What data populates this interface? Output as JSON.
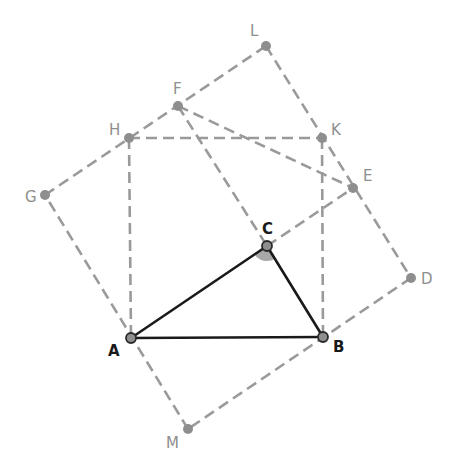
{
  "diagram": {
    "title": "",
    "colors": {
      "background": "#ffffff",
      "dashed_line": "#9a9a9a",
      "solid_line": "#1a1a1a",
      "point_fill_gray": "#8e8e8e",
      "point_fill_main": "#8e8e8e",
      "point_stroke_main": "#2a2a2a",
      "angle_fill": "#a8a8a8"
    },
    "points": [
      {
        "id": "A",
        "label": "A",
        "x": 131,
        "y": 338,
        "main": true,
        "lx": 108,
        "ly": 356
      },
      {
        "id": "B",
        "label": "B",
        "x": 323,
        "y": 337,
        "main": true,
        "lx": 333,
        "ly": 352
      },
      {
        "id": "C",
        "label": "C",
        "x": 267,
        "y": 246,
        "main": true,
        "lx": 262,
        "ly": 234
      },
      {
        "id": "D",
        "label": "D",
        "x": 411,
        "y": 278,
        "main": false,
        "lx": 421,
        "ly": 284
      },
      {
        "id": "E",
        "label": "E",
        "x": 353,
        "y": 188,
        "main": false,
        "lx": 363,
        "ly": 181
      },
      {
        "id": "F",
        "label": "F",
        "x": 178,
        "y": 106,
        "main": false,
        "lx": 173,
        "ly": 94
      },
      {
        "id": "G",
        "label": "G",
        "x": 45,
        "y": 195,
        "main": false,
        "lx": 25,
        "ly": 202
      },
      {
        "id": "H",
        "label": "H",
        "x": 129,
        "y": 138,
        "main": false,
        "lx": 109,
        "ly": 135
      },
      {
        "id": "K",
        "label": "K",
        "x": 322,
        "y": 138,
        "main": false,
        "lx": 331,
        "ly": 135
      },
      {
        "id": "L",
        "label": "L",
        "x": 266,
        "y": 46,
        "main": false,
        "lx": 250,
        "ly": 36
      },
      {
        "id": "M",
        "label": "M",
        "x": 188,
        "y": 429,
        "main": false,
        "lx": 166,
        "ly": 448
      }
    ],
    "solid_segments": [
      [
        "A",
        "B"
      ],
      [
        "B",
        "C"
      ],
      [
        "C",
        "A"
      ]
    ],
    "dashed_segments": [
      [
        "H",
        "K"
      ],
      [
        "H",
        "A"
      ],
      [
        "K",
        "B"
      ],
      [
        "G",
        "L"
      ],
      [
        "L",
        "D"
      ],
      [
        "D",
        "M"
      ],
      [
        "M",
        "G"
      ],
      [
        "F",
        "C"
      ],
      [
        "C",
        "E"
      ],
      [
        "F",
        "E"
      ]
    ],
    "angle_marker": {
      "vertex": "C",
      "from": "A",
      "to": "B",
      "radius": 15
    }
  }
}
